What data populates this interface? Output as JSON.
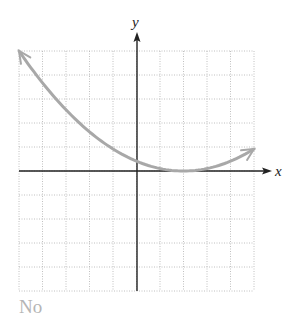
{
  "chart_data": {
    "type": "line",
    "title": "",
    "xlabel": "x",
    "ylabel": "y",
    "xlim": [
      -5,
      5
    ],
    "ylim": [
      -5,
      5
    ],
    "grid": true,
    "grid_step": 1,
    "series": [
      {
        "name": "parabola",
        "equation": "y = (5/49)(x - 2)^2",
        "vertex": [
          2,
          0
        ],
        "x": [
          -5,
          -4,
          -3,
          -2,
          -1,
          0,
          1,
          2,
          3,
          4,
          5
        ],
        "values": [
          5.0,
          3.67,
          2.55,
          1.63,
          0.92,
          0.41,
          0.1,
          0.0,
          0.1,
          0.41,
          0.92
        ],
        "color": "#a8a8a8",
        "arrows": "both"
      }
    ]
  },
  "labels": {
    "x_axis": "x",
    "y_axis": "y",
    "answer": "No"
  },
  "colors": {
    "axis": "#222222",
    "grid": "#b0b0b0",
    "curve": "#a8a8a8",
    "answer_text": "#b5b5b5"
  }
}
